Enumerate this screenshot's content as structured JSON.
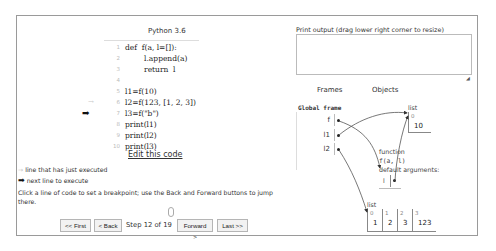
{
  "code_panel": {
    "language": "Python 3.6",
    "lines": [
      {
        "num": "1",
        "text": "def  f(a, l=[]):"
      },
      {
        "num": "2",
        "text": "        l.append(a)"
      },
      {
        "num": "3",
        "text": "        return  l"
      },
      {
        "num": "4",
        "text": ""
      },
      {
        "num": "5",
        "text": "l1=f(10)"
      },
      {
        "num": "6",
        "text": "l2=f(123, [1, 2, 3])"
      },
      {
        "num": "7",
        "text": "l3=f(\"b\")"
      },
      {
        "num": "8",
        "text": "print(l1)"
      },
      {
        "num": "9",
        "text": "print(l2)"
      },
      {
        "num": "10",
        "text": "print(l3)"
      }
    ],
    "prev_line_arrow": "→",
    "next_line_arrow": "➡",
    "edit_link": "Edit this code"
  },
  "legend": {
    "prev_arrow": "→",
    "prev_label": "line that has just executed",
    "next_arrow": "➡",
    "next_label": "next line to execute"
  },
  "hint": "Click a line of code to set a breakpoint; use the Back and Forward buttons to jump there.",
  "navigation": {
    "first": "<< First",
    "back": "< Back",
    "step_text": "Step 12 of 19",
    "forward": "Forward >",
    "last": "Last >>"
  },
  "print_output": {
    "label": "Print output (drag lower right corner to resize)",
    "value": "",
    "resize_glyph": "◢"
  },
  "visualizer": {
    "frames_header": "Frames",
    "objects_header": "Objects",
    "global_frame": {
      "title": "Global frame",
      "vars": [
        "f",
        "l1",
        "l2"
      ]
    },
    "list1": {
      "type": "list",
      "indices": [
        "0"
      ],
      "values": [
        "10"
      ]
    },
    "function": {
      "type": "function",
      "signature": "f(a,  l)",
      "defaults_label": "default arguments:",
      "default_var": "l"
    },
    "list2": {
      "type": "list",
      "indices": [
        "0",
        "1",
        "2",
        "3"
      ],
      "values": [
        "1",
        "2",
        "3",
        "123"
      ]
    }
  }
}
